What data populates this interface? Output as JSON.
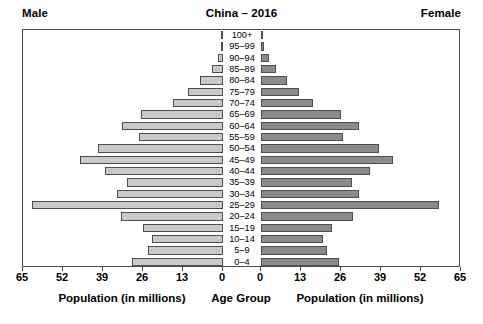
{
  "header": {
    "male_label": "Male",
    "title": "China – 2016",
    "female_label": "Female"
  },
  "axis_titles": {
    "left": "Population (in millions)",
    "center": "Age Group",
    "right": "Population (in millions)"
  },
  "colors": {
    "male_bar": "#c9c9c9",
    "female_bar": "#8b8b8b",
    "bar_outline": "#4f4f4f",
    "frame": "#4a4a4a",
    "text": "#000000",
    "background": "#ffffff"
  },
  "chart_data": {
    "type": "bar",
    "subtype": "population-pyramid",
    "title": "China – 2016",
    "xlabel": "Population (in millions)",
    "ylabel": "Age Group",
    "grid": false,
    "legend_position": "none",
    "xlim": [
      0,
      65
    ],
    "xticks": [
      0,
      13,
      26,
      39,
      52,
      65
    ],
    "left_xticks": [
      65,
      52,
      39,
      26,
      13,
      0
    ],
    "right_xticks": [
      0,
      13,
      26,
      39,
      52,
      65
    ],
    "categories": [
      "100+",
      "95–99",
      "90–94",
      "85–89",
      "80–84",
      "75–79",
      "70–74",
      "65–69",
      "60–64",
      "55–59",
      "50–54",
      "45–49",
      "40–44",
      "35–39",
      "30–34",
      "25–29",
      "20–24",
      "15–19",
      "10–14",
      "5–9",
      "0–4"
    ],
    "series": [
      {
        "name": "Male",
        "side": "left",
        "color": "#c9c9c9",
        "values": [
          0.1,
          0.6,
          1.7,
          3.7,
          7.4,
          11.5,
          16.3,
          26.5,
          32.8,
          27.3,
          40.5,
          46.5,
          38.5,
          31.2,
          34.5,
          62.0,
          33.0,
          26.0,
          23.0,
          24.5,
          29.5
        ]
      },
      {
        "name": "Female",
        "side": "right",
        "color": "#8b8b8b",
        "values": [
          0.2,
          1.0,
          2.5,
          5.0,
          8.5,
          12.5,
          17.0,
          26.0,
          32.0,
          26.5,
          38.5,
          43.0,
          35.5,
          29.5,
          32.0,
          58.0,
          30.0,
          23.0,
          20.0,
          21.5,
          25.5
        ]
      }
    ]
  }
}
